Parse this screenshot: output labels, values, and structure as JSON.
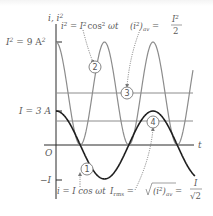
{
  "figure": {
    "axes": {
      "y_label": "i, i",
      "y_label_sup": "2",
      "x_label": "t",
      "origin_label": "O"
    },
    "y_ticks": {
      "i2_peak": {
        "text": "I",
        "sup": "2",
        "eq": " = 9 A",
        "eq_sup": "2"
      },
      "i_peak": {
        "text": "I = 3 A"
      },
      "i_neg": {
        "text": "−I"
      }
    },
    "annotations": {
      "eq_i2": {
        "lhs": "i",
        "lhs_sup": "2",
        "eq": " = I",
        "eq_sup": "2",
        "rest": "cos",
        "rest_sup": "2",
        "tail": " ωt"
      },
      "eq_i2_avg": {
        "lhs": "(i",
        "lhs_sup": "2",
        "close": ")",
        "sub": "av",
        "eq": " = ",
        "num": "I",
        "num_sup": "2",
        "den": "2"
      },
      "eq_i": {
        "text": "i = I cos ωt"
      },
      "eq_irms": {
        "lhs": "I",
        "lhs_sub": "rms",
        "eq": " = ",
        "root_body": "(i",
        "root_sup": "2",
        "root_close": ")",
        "root_sub": "av",
        "eq2": " = ",
        "num": "I",
        "den": "√2"
      }
    },
    "markers": [
      "1",
      "2",
      "3",
      "4"
    ],
    "colors": {
      "i_curve": "#1e1e1e",
      "i2_curve": "#8c8c8c",
      "ref_lines": "#8c8c8c",
      "axis": "#2a2a2a",
      "text": "#5a5a5a"
    }
  },
  "chart_data": {
    "type": "line",
    "title": "",
    "xlabel": "t",
    "ylabel": "i, i²",
    "series": [
      {
        "name": "i = I cos ωt",
        "amplitude_A": 3,
        "marker": "1"
      },
      {
        "name": "i² = I² cos² ωt",
        "peak_A2": 9,
        "marker": "2"
      },
      {
        "name": "(i²)av = I²/2",
        "value_A2": 4.5,
        "marker": "3"
      },
      {
        "name": "Irms = √((i²)av) = I/√2",
        "value_A": 2.12,
        "marker": "4"
      }
    ],
    "y_ticks": [
      "I² = 9 A²",
      "I = 3 A",
      "O",
      "−I"
    ],
    "grid": false
  }
}
